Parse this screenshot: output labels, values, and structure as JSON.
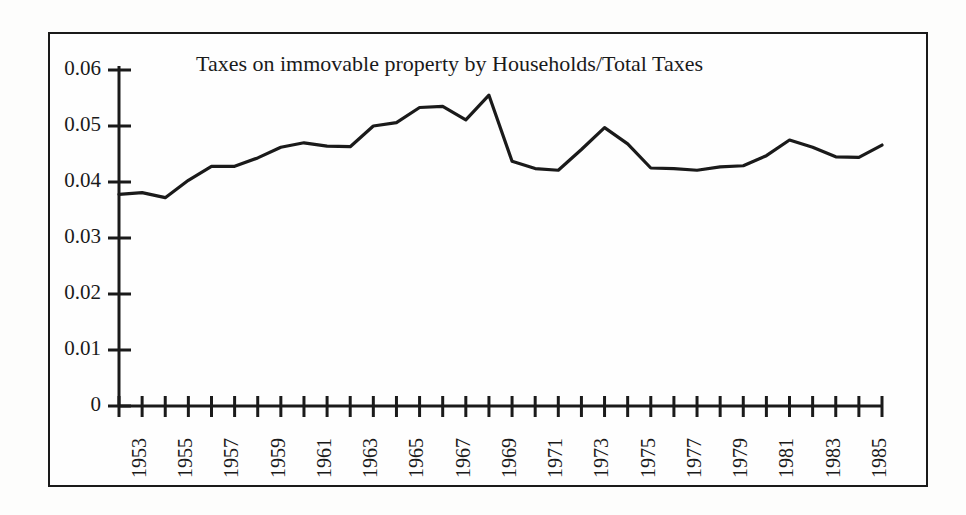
{
  "chart_data": {
    "type": "line",
    "title": "Taxes on immovable property by Households/Total Taxes",
    "xlabel": "",
    "ylabel": "",
    "ylim": [
      0,
      0.06
    ],
    "xlim": [
      1953,
      1986
    ],
    "grid": false,
    "legend": null,
    "y_ticks": [
      "0",
      "0.01",
      "0.02",
      "0.03",
      "0.04",
      "0.05",
      "0.06"
    ],
    "y_tick_values": [
      0,
      0.01,
      0.02,
      0.03,
      0.04,
      0.05,
      0.06
    ],
    "x_tick_labels": [
      "1953",
      "1955",
      "1957",
      "1959",
      "1961",
      "1963",
      "1965",
      "1967",
      "1969",
      "1971",
      "1973",
      "1975",
      "1977",
      "1979",
      "1981",
      "1983",
      "1985"
    ],
    "x_tick_label_step": 2,
    "line_color": "#1a1a1a",
    "x": [
      1953,
      1954,
      1955,
      1956,
      1957,
      1958,
      1959,
      1960,
      1961,
      1962,
      1963,
      1964,
      1965,
      1966,
      1967,
      1968,
      1969,
      1970,
      1971,
      1972,
      1973,
      1974,
      1975,
      1976,
      1977,
      1978,
      1979,
      1980,
      1981,
      1982,
      1983,
      1984,
      1985,
      1986
    ],
    "values": [
      0.0378,
      0.0381,
      0.0372,
      0.0403,
      0.0428,
      0.0428,
      0.0443,
      0.0462,
      0.047,
      0.0464,
      0.0463,
      0.05,
      0.0506,
      0.0533,
      0.0535,
      0.0511,
      0.0555,
      0.0437,
      0.0424,
      0.0421,
      0.0458,
      0.0497,
      0.0468,
      0.0425,
      0.0424,
      0.0421,
      0.0427,
      0.0429,
      0.0447,
      0.0475,
      0.0462,
      0.0445,
      0.0444,
      0.0466
    ],
    "series": [
      {
        "name": "Taxes on immovable property by Households/Total Taxes",
        "values": [
          0.0378,
          0.0381,
          0.0372,
          0.0403,
          0.0428,
          0.0428,
          0.0443,
          0.0462,
          0.047,
          0.0464,
          0.0463,
          0.05,
          0.0506,
          0.0533,
          0.0535,
          0.0511,
          0.0555,
          0.0437,
          0.0424,
          0.0421,
          0.0458,
          0.0497,
          0.0468,
          0.0425,
          0.0424,
          0.0421,
          0.0427,
          0.0429,
          0.0447,
          0.0475,
          0.0462,
          0.0445,
          0.0444,
          0.0466
        ]
      }
    ]
  }
}
